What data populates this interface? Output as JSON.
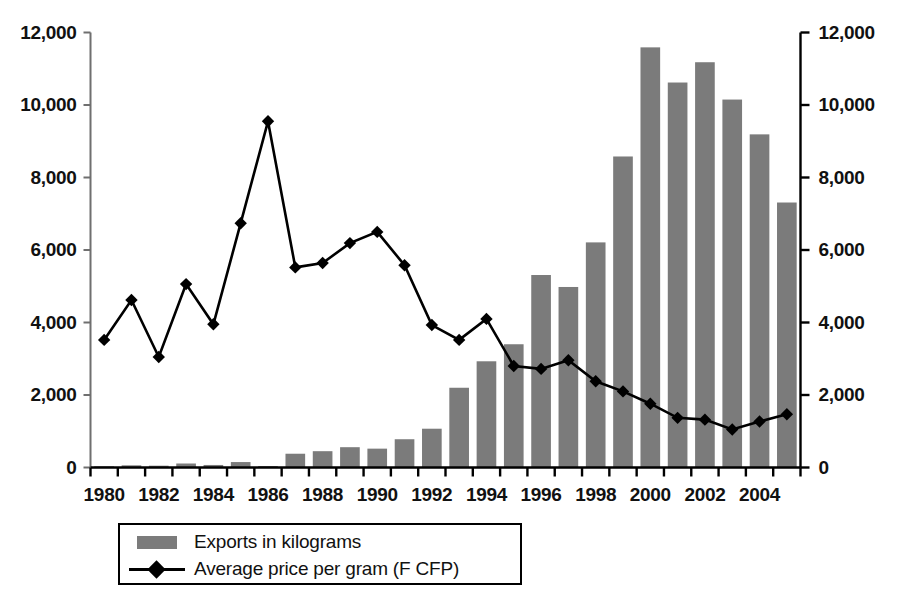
{
  "chart_data": {
    "type": "bar",
    "title": "",
    "subtitle": "",
    "xlabel": "",
    "ylabel": "",
    "ylabel_right": "",
    "grid": false,
    "legend_position": "bottom",
    "x": [
      1980,
      1981,
      1982,
      1983,
      1984,
      1985,
      1986,
      1987,
      1988,
      1989,
      1990,
      1991,
      1992,
      1993,
      1994,
      1995,
      1996,
      1997,
      1998,
      1999,
      2000,
      2001,
      2002,
      2003,
      2004,
      2005
    ],
    "categories": [
      "1980",
      "1981",
      "1982",
      "1983",
      "1984",
      "1985",
      "1986",
      "1987",
      "1988",
      "1989",
      "1990",
      "1991",
      "1992",
      "1993",
      "1994",
      "1995",
      "1996",
      "1997",
      "1998",
      "1999",
      "2000",
      "2001",
      "2002",
      "2003",
      "2004",
      "2005"
    ],
    "xtick_labels": [
      "1980",
      "1982",
      "1984",
      "1986",
      "1988",
      "1990",
      "1992",
      "1994",
      "1996",
      "1998",
      "2000",
      "2002",
      "2004"
    ],
    "ytick_labels": [
      "0",
      "2,000",
      "4,000",
      "6,000",
      "8,000",
      "10,000",
      "12,000"
    ],
    "ytick_values": [
      0,
      2000,
      4000,
      6000,
      8000,
      10000,
      12000
    ],
    "ylim": [
      0,
      12000
    ],
    "ylim_right": [
      0,
      12000
    ],
    "series": [
      {
        "name": "Exports in kilograms",
        "type": "bar",
        "axis": "left",
        "color": "#7b7b7b",
        "values": [
          30,
          60,
          50,
          110,
          70,
          150,
          40,
          380,
          450,
          560,
          520,
          780,
          1070,
          2200,
          2930,
          3400,
          5310,
          4980,
          6210,
          8580,
          11590,
          10620,
          11180,
          10150,
          9190,
          7310
        ]
      },
      {
        "name": "Average price per gram (F CFP)",
        "type": "line",
        "axis": "right",
        "color": "#000000",
        "marker": "diamond",
        "values": [
          3520,
          4620,
          3050,
          5060,
          3950,
          6740,
          9550,
          5520,
          5640,
          6190,
          6500,
          5580,
          3930,
          3520,
          4100,
          2800,
          2720,
          2960,
          2380,
          2100,
          1760,
          1370,
          1320,
          1050,
          1270,
          1470
        ]
      }
    ],
    "legend": [
      {
        "label": "Exports in kilograms",
        "swatch": "bar",
        "color": "#7b7b7b"
      },
      {
        "label": "Average price per gram (F CFP)",
        "swatch": "line-diamond",
        "color": "#000000"
      }
    ]
  },
  "colors": {
    "bar": "#7b7b7b",
    "line": "#000000",
    "axis": "#000000",
    "background": "#ffffff",
    "text": "#111111"
  }
}
